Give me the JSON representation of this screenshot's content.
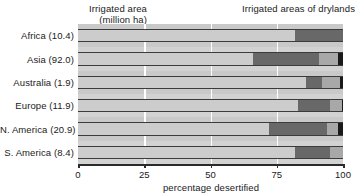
{
  "header": {
    "left_line1": "Irrigated area",
    "left_line2": "(million ha)",
    "right_title": "Irrigated areas of drylands"
  },
  "axis": {
    "title": "percentage desertified",
    "ticks": [
      "0",
      "25",
      "50",
      "75",
      "100"
    ]
  },
  "chart_data": {
    "type": "bar",
    "orientation": "horizontal",
    "stacked": true,
    "title": "Irrigated areas of drylands",
    "xlabel": "percentage desertified",
    "ylabel": "Irrigated area (million ha)",
    "xlim": [
      0,
      100
    ],
    "xticks": [
      0,
      25,
      50,
      75,
      100
    ],
    "grid": true,
    "legend": "none",
    "categories": [
      "Africa (10.4)",
      "Asia (92.0)",
      "Australia (1.9)",
      "Europe (11.9)",
      "N. America (20.9)",
      "S. America (8.4)"
    ],
    "category_names": [
      "Africa",
      "Asia",
      "Australia",
      "Europe",
      "N. America",
      "S. America"
    ],
    "irrigated_area_million_ha": [
      10.4,
      92.0,
      1.9,
      11.9,
      20.9,
      8.4
    ],
    "series": [
      {
        "name": "not desertified",
        "color": "#cccccc",
        "values": [
          82,
          66,
          86,
          83,
          72,
          82
        ]
      },
      {
        "name": "slight/moderate",
        "color": "#686868",
        "values": [
          18,
          25,
          6,
          12,
          22,
          13
        ]
      },
      {
        "name": "severe",
        "color": "#a8a8a8",
        "values": [
          0,
          7,
          7,
          4.5,
          4,
          5
        ]
      },
      {
        "name": "very severe",
        "color": "#1a1a1a",
        "values": [
          0,
          2,
          1,
          0.5,
          2,
          0
        ]
      }
    ],
    "bars": [
      {
        "label": "Africa (10.4)",
        "segments": [
          {
            "color": "#cccccc",
            "pct": 82
          },
          {
            "color": "#686868",
            "pct": 18
          }
        ]
      },
      {
        "label": "Asia (92.0)",
        "segments": [
          {
            "color": "#cccccc",
            "pct": 66
          },
          {
            "color": "#686868",
            "pct": 25
          },
          {
            "color": "#a8a8a8",
            "pct": 7
          },
          {
            "color": "#1a1a1a",
            "pct": 2
          }
        ]
      },
      {
        "label": "Australia (1.9)",
        "segments": [
          {
            "color": "#cccccc",
            "pct": 86
          },
          {
            "color": "#686868",
            "pct": 6
          },
          {
            "color": "#a8a8a8",
            "pct": 7
          },
          {
            "color": "#1a1a1a",
            "pct": 1
          }
        ]
      },
      {
        "label": "Europe (11.9)",
        "segments": [
          {
            "color": "#cccccc",
            "pct": 83
          },
          {
            "color": "#686868",
            "pct": 12
          },
          {
            "color": "#a8a8a8",
            "pct": 4.5
          },
          {
            "color": "#1a1a1a",
            "pct": 0.5
          }
        ]
      },
      {
        "label": "N. America (20.9)",
        "segments": [
          {
            "color": "#cccccc",
            "pct": 72
          },
          {
            "color": "#686868",
            "pct": 22
          },
          {
            "color": "#a8a8a8",
            "pct": 4
          },
          {
            "color": "#1a1a1a",
            "pct": 2
          }
        ]
      },
      {
        "label": "S. America (8.4)",
        "segments": [
          {
            "color": "#cccccc",
            "pct": 82
          },
          {
            "color": "#686868",
            "pct": 13
          },
          {
            "color": "#a8a8a8",
            "pct": 5
          }
        ]
      }
    ]
  },
  "colors": {
    "plot_background": "#d2d2d2",
    "band": "#c9c9c9",
    "gridline": "#ffffff",
    "axis": "#2b2b2b",
    "text": "#1a1a1a"
  }
}
